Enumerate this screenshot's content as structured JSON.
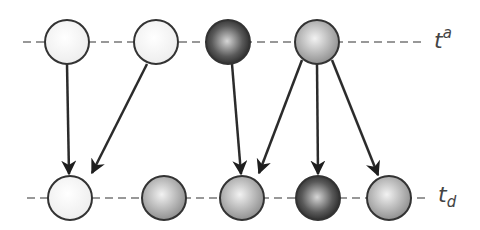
{
  "rows": {
    "top": {
      "label": "t",
      "superscript": "a",
      "y": 42
    },
    "bottom": {
      "label": "t",
      "subscript": "d",
      "y": 198
    }
  },
  "nodes": {
    "top": [
      {
        "x": 67,
        "fill": "white"
      },
      {
        "x": 156,
        "fill": "white"
      },
      {
        "x": 228,
        "fill": "dark"
      },
      {
        "x": 317,
        "fill": "gray"
      }
    ],
    "bottom": [
      {
        "x": 70,
        "fill": "white"
      },
      {
        "x": 164,
        "fill": "gray"
      },
      {
        "x": 242,
        "fill": "gray"
      },
      {
        "x": 318,
        "fill": "dark"
      },
      {
        "x": 389,
        "fill": "gray"
      }
    ]
  },
  "edges": [
    {
      "from": "top.0",
      "to": "bottom.0"
    },
    {
      "from": "top.1",
      "to": "bottom.0"
    },
    {
      "from": "top.2",
      "to": "bottom.2"
    },
    {
      "from": "top.3",
      "to": "bottom.2"
    },
    {
      "from": "top.3",
      "to": "bottom.3"
    },
    {
      "from": "top.3",
      "to": "bottom.4"
    }
  ],
  "colors": {
    "line": "#2b2b2b",
    "dash": "#777777"
  }
}
